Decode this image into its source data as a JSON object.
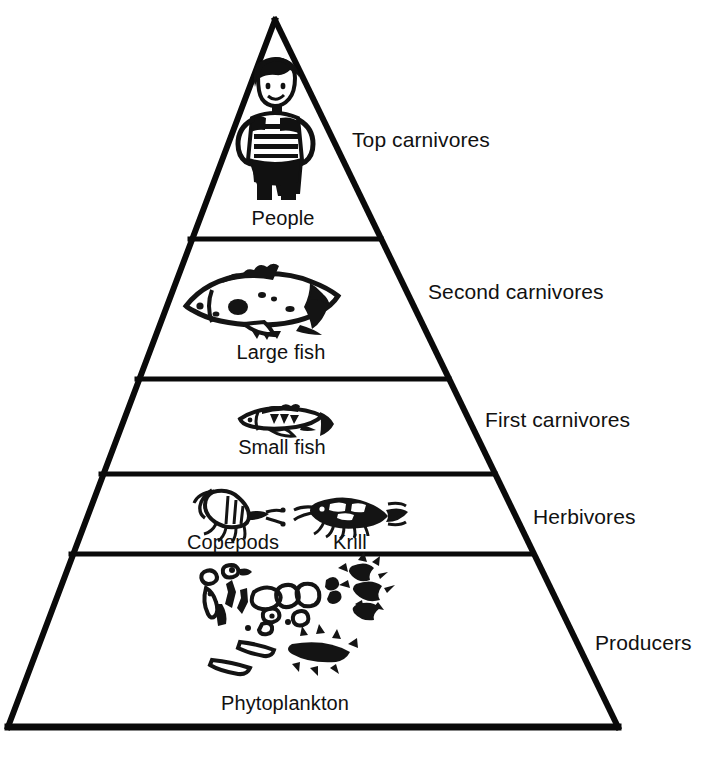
{
  "figure": {
    "name": "Marine ecological pyramid",
    "style": "black-and-white line drawing",
    "tiers": [
      {
        "organism": "People",
        "trophic_level": "Top carnivores",
        "icon": "person-figure-icon"
      },
      {
        "organism": "Large fish",
        "trophic_level": "Second carnivores",
        "icon": "large-fish-icon"
      },
      {
        "organism": "Small fish",
        "trophic_level": "First carnivores",
        "icon": "small-fish-icon"
      },
      {
        "organism": "Copepods",
        "organism_secondary": "Krill",
        "trophic_level": "Herbivores",
        "icon": "copepod-icon",
        "icon_secondary": "krill-icon"
      },
      {
        "organism": "Phytoplankton",
        "trophic_level": "Producers",
        "icon": "phytoplankton-cluster-icon"
      }
    ]
  },
  "colors": {
    "ink": "#000000",
    "background": "#ffffff"
  }
}
